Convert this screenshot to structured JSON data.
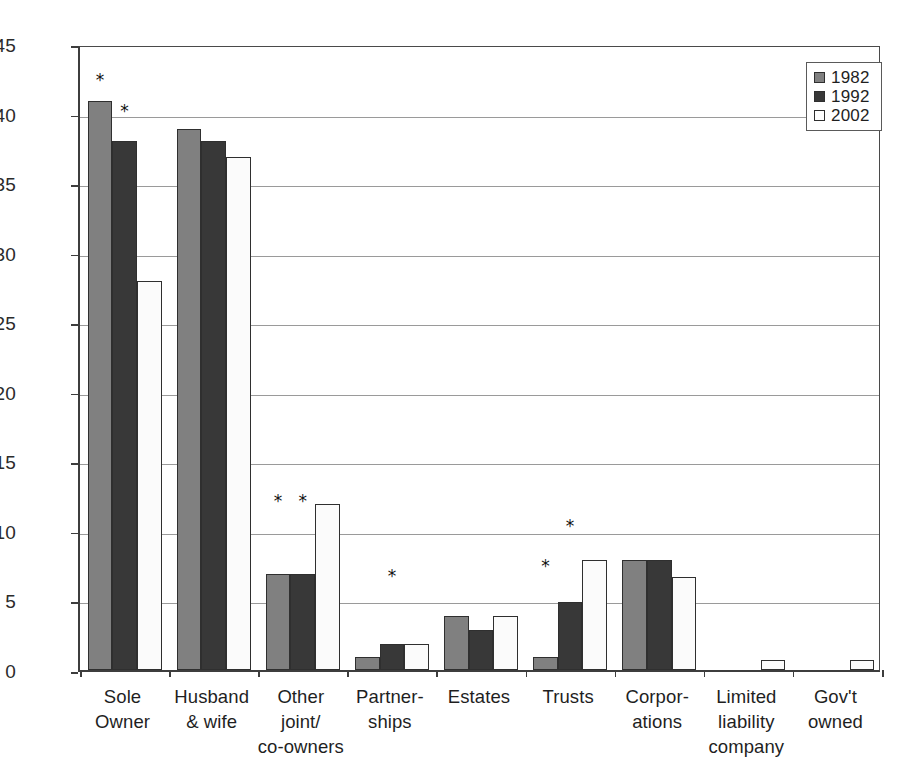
{
  "chart_data": {
    "type": "bar",
    "title": "",
    "subtitle": "",
    "xlabel": "",
    "ylabel": "Percentage",
    "ylim": [
      0,
      45
    ],
    "ytick_step": 5,
    "yticks": [
      0,
      5,
      10,
      15,
      20,
      25,
      30,
      35,
      40,
      45
    ],
    "grid": true,
    "legend_position": "top-right",
    "categories": [
      "Sole\nOwner",
      "Husband\n& wife",
      "Other\njoint/\nco-owners",
      "Partner-\nships",
      "Estates",
      "Trusts",
      "Corpor-\nations",
      "Limited\nliability\ncompany",
      "Gov't\nowned"
    ],
    "series": [
      {
        "name": "1982",
        "color": "#808080",
        "values": [
          40.9,
          38.9,
          6.9,
          0.9,
          3.9,
          0.9,
          7.9,
          0,
          0
        ]
      },
      {
        "name": "1992",
        "color": "#383838",
        "values": [
          38.0,
          38.0,
          6.9,
          1.9,
          2.9,
          4.9,
          7.9,
          0,
          0
        ]
      },
      {
        "name": "2002",
        "color": "#ffffff",
        "values": [
          28.0,
          36.9,
          11.9,
          1.9,
          3.9,
          7.9,
          6.7,
          0.7,
          0.7
        ]
      }
    ],
    "annotations": [
      {
        "symbol": "*",
        "category_index": 0,
        "series_index": 0,
        "value": 42.6
      },
      {
        "symbol": "*",
        "category_index": 0,
        "series_index": 1,
        "value": 40.4
      },
      {
        "symbol": "*",
        "category_index": 2,
        "series_index": 0,
        "value": 12.4
      },
      {
        "symbol": "*",
        "category_index": 2,
        "series_index": 1,
        "value": 12.4
      },
      {
        "symbol": "*",
        "category_index": 3,
        "series_index": 1,
        "value": 7.0
      },
      {
        "symbol": "*",
        "category_index": 5,
        "series_index": 1,
        "value": 10.6
      },
      {
        "symbol": "*",
        "category_index": 5,
        "series_index": 0,
        "value": 7.7
      }
    ]
  },
  "legend": {
    "entries": [
      {
        "label": "1982"
      },
      {
        "label": "1992"
      },
      {
        "label": "2002"
      }
    ]
  },
  "axis": {
    "y_title": "Percentage",
    "y_labels": [
      "45",
      "40",
      "35",
      "30",
      "25",
      "20",
      "15",
      "10",
      "5",
      "0"
    ]
  }
}
